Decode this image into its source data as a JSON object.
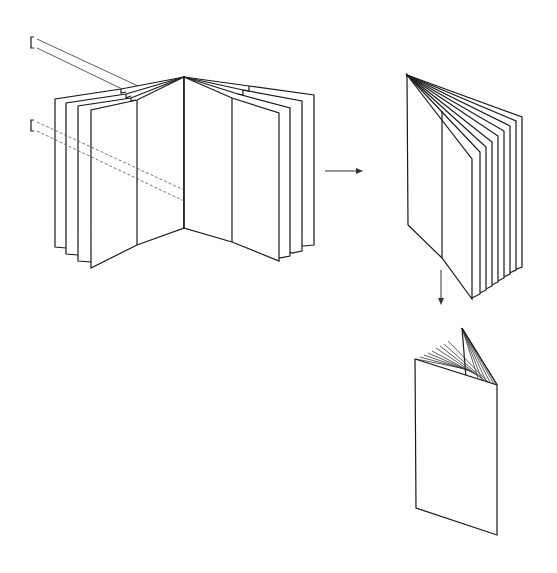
{
  "figure": {
    "type": "patent-style line drawing",
    "colors": {
      "line": "#1a1a1a",
      "background": "#ffffff",
      "dashed": "#555555"
    }
  },
  "stages": [
    {
      "id": "stage-1",
      "label": "open-spread-sheets-with-insert-strips"
    },
    {
      "id": "stage-2",
      "label": "sheets-gathered-at-spine"
    },
    {
      "id": "stage-3",
      "label": "closed-booklet"
    }
  ],
  "arrows": [
    {
      "id": "arrow-right",
      "from": "stage-1",
      "to": "stage-2",
      "direction": "right"
    },
    {
      "id": "arrow-down",
      "from": "stage-2",
      "to": "stage-3",
      "direction": "down"
    }
  ]
}
